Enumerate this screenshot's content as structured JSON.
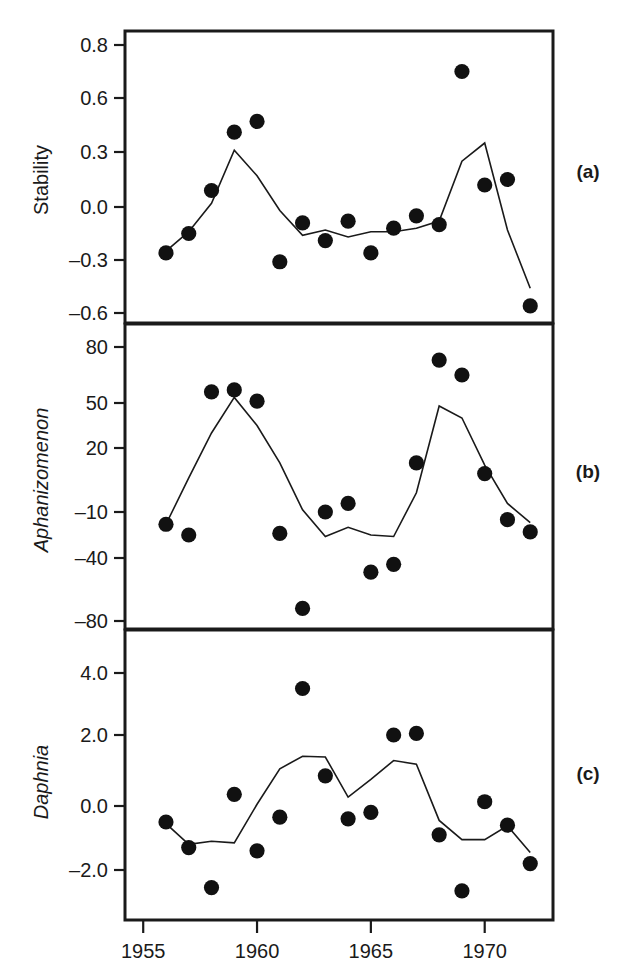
{
  "figure": {
    "panels": [
      {
        "key": "a",
        "label": "(a)",
        "ylabel": "Stability",
        "ylabel_italic": false
      },
      {
        "key": "b",
        "label": "(b)",
        "ylabel": "Aphanizomenon",
        "ylabel_italic": true
      },
      {
        "key": "c",
        "label": "(c)",
        "ylabel": "Daphnia",
        "ylabel_italic": true
      }
    ],
    "xaxis": {
      "ticks": [
        1955,
        1960,
        1965,
        1970
      ],
      "tick_labels": [
        "1955",
        "1960",
        "1965",
        "1970"
      ],
      "range": [
        1954.2,
        1973.0
      ]
    },
    "colors": {
      "line": "#1a1a1a",
      "point": "#111111",
      "frame": "#1a1a1a",
      "background": "#ffffff"
    }
  },
  "chart_data": [
    {
      "type": "scatter",
      "panel": "a",
      "title": "",
      "xlabel": "",
      "ylabel": "Stability",
      "legend": [],
      "grid": false,
      "xlim": [
        1954.2,
        1973.0
      ],
      "ytick_values": [
        0.8,
        0.6,
        0.3,
        0.0,
        -0.3,
        -0.6
      ],
      "ytick_labels": [
        "0.8",
        "0.6",
        "0.3",
        "0.0",
        "-0.3",
        "-0.6"
      ],
      "ytick_pixel_y": [
        45,
        98,
        152,
        207,
        260,
        313
      ],
      "x": [
        1956,
        1957,
        1958,
        1959,
        1960,
        1961,
        1962,
        1963,
        1964,
        1965,
        1966,
        1967,
        1968,
        1969,
        1970,
        1971,
        1972
      ],
      "series": [
        {
          "name": "observed",
          "kind": "points",
          "values": [
            -0.26,
            -0.15,
            0.09,
            0.41,
            0.47,
            -0.31,
            -0.09,
            -0.19,
            -0.08,
            -0.26,
            -0.12,
            -0.05,
            -0.1,
            0.7,
            0.12,
            0.15,
            -0.56
          ]
        },
        {
          "name": "predicted",
          "kind": "line",
          "values": [
            -0.25,
            -0.14,
            0.02,
            0.31,
            0.17,
            -0.02,
            -0.16,
            -0.13,
            -0.17,
            -0.14,
            -0.14,
            -0.12,
            -0.08,
            0.25,
            0.35,
            -0.13,
            -0.46
          ]
        }
      ]
    },
    {
      "type": "scatter",
      "panel": "b",
      "title": "",
      "xlabel": "",
      "ylabel": "Aphanizomenon",
      "legend": [],
      "grid": false,
      "xlim": [
        1954.2,
        1973.0
      ],
      "ytick_values": [
        80,
        50,
        20,
        -10,
        -40,
        -80
      ],
      "ytick_labels": [
        "80",
        "50",
        "20",
        "-10",
        "-40",
        "-80"
      ],
      "ytick_pixel_y": [
        347,
        403,
        448,
        512,
        558,
        621
      ],
      "x": [
        1956,
        1957,
        1958,
        1959,
        1960,
        1961,
        1962,
        1963,
        1964,
        1965,
        1966,
        1967,
        1968,
        1969,
        1970,
        1971,
        1972
      ],
      "series": [
        {
          "name": "observed",
          "kind": "points",
          "values": [
            -18,
            -25,
            56,
            57,
            51,
            -24,
            -72,
            -10,
            -6,
            -49,
            -44,
            13,
            73,
            65,
            8,
            -15,
            -23
          ]
        },
        {
          "name": "predicted",
          "kind": "line",
          "values": [
            -18,
            6,
            30,
            53,
            35,
            13,
            -9,
            -26,
            -20,
            -25,
            -26,
            -1,
            48,
            40,
            12,
            -6,
            -17
          ]
        }
      ]
    },
    {
      "type": "scatter",
      "panel": "c",
      "title": "",
      "xlabel": "",
      "ylabel": "Daphnia",
      "legend": [],
      "grid": false,
      "xlim": [
        1954.2,
        1973.0
      ],
      "ytick_values": [
        4.0,
        2.0,
        0.0,
        -2.0
      ],
      "ytick_labels": [
        "4.0",
        "2.0",
        "0.0",
        "-2.0"
      ],
      "ytick_pixel_y": [
        673,
        735,
        806,
        870
      ],
      "x": [
        1956,
        1957,
        1958,
        1959,
        1960,
        1961,
        1962,
        1963,
        1964,
        1965,
        1966,
        1967,
        1968,
        1969,
        1970,
        1971,
        1972
      ],
      "series": [
        {
          "name": "observed",
          "kind": "points",
          "values": [
            -0.5,
            -1.3,
            -2.55,
            0.33,
            -1.4,
            -0.35,
            3.5,
            0.85,
            -0.4,
            -0.2,
            2.0,
            2.05,
            -0.9,
            -2.65,
            0.12,
            -0.6,
            -1.8
          ]
        },
        {
          "name": "predicted",
          "kind": "line",
          "values": [
            -0.55,
            -1.2,
            -1.1,
            -1.15,
            0.05,
            1.05,
            1.4,
            1.38,
            0.25,
            0.75,
            1.28,
            1.18,
            -0.45,
            -1.05,
            -1.05,
            -0.62,
            -1.45
          ]
        }
      ]
    }
  ]
}
